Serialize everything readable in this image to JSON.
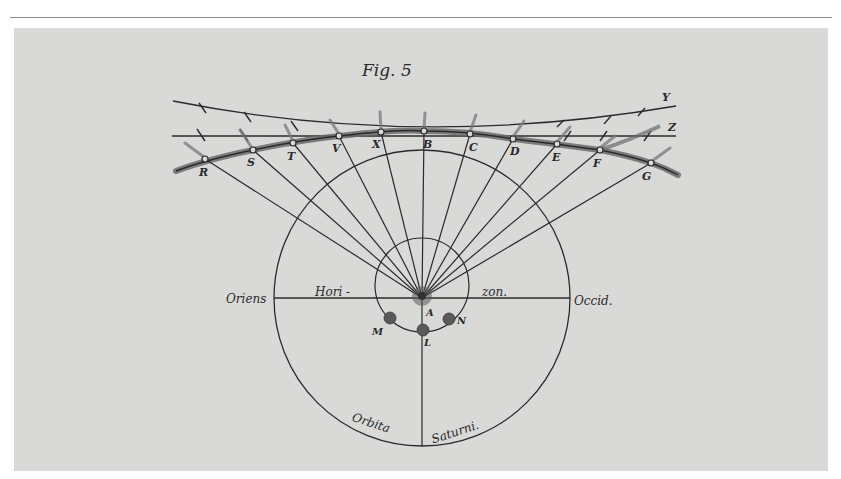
{
  "figure": {
    "title": "Fig. 5",
    "colors": {
      "page_background": "#ffffff",
      "plate_background": "#d9d9d7",
      "ink": "#2a2a2a",
      "thick_path": "#6b6b6b"
    },
    "horizon": {
      "left_label": "Oriens",
      "right_label": "Occid.",
      "word_left": "Hori -",
      "word_right": "zon."
    },
    "orbit_labels": {
      "left": "Orbita",
      "right": "Saturni."
    },
    "center_label": "A",
    "earth_positions": [
      {
        "label": "M",
        "x": 390,
        "y": 318
      },
      {
        "label": "L",
        "x": 423,
        "y": 330
      },
      {
        "label": "N",
        "x": 449,
        "y": 319
      }
    ],
    "path_points": [
      {
        "label": "R",
        "x": 205,
        "y": 159
      },
      {
        "label": "S",
        "x": 253,
        "y": 150
      },
      {
        "label": "T",
        "x": 293,
        "y": 143
      },
      {
        "label": "V",
        "x": 339,
        "y": 136
      },
      {
        "label": "X",
        "x": 381,
        "y": 132
      },
      {
        "label": "B",
        "x": 424,
        "y": 131
      },
      {
        "label": "C",
        "x": 470,
        "y": 134
      },
      {
        "label": "D",
        "x": 513,
        "y": 139
      },
      {
        "label": "E",
        "x": 557,
        "y": 144
      },
      {
        "label": "F",
        "x": 600,
        "y": 150
      },
      {
        "label": "G",
        "x": 651,
        "y": 163
      }
    ],
    "reference_lines": [
      {
        "label": "Y"
      },
      {
        "label": "Z"
      }
    ]
  }
}
